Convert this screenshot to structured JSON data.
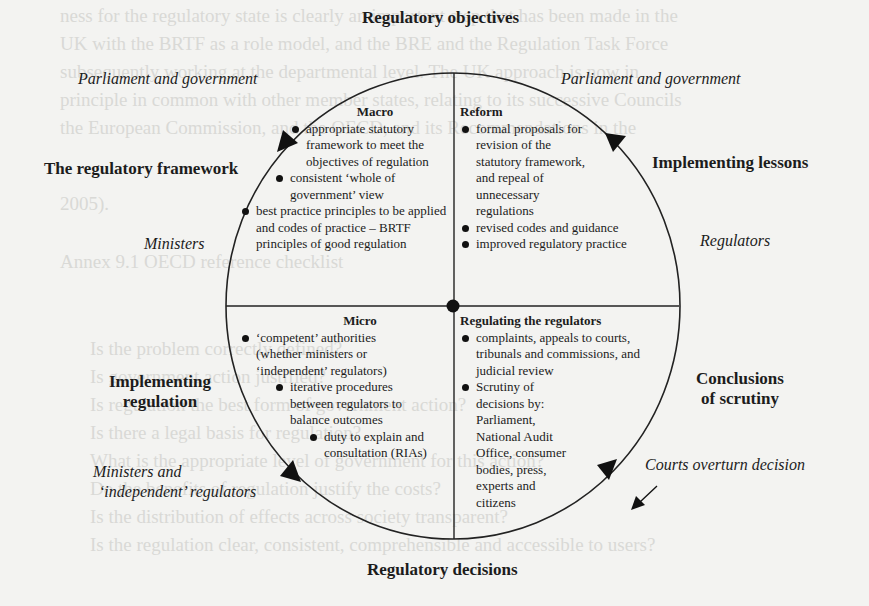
{
  "diagram": {
    "title_top": "Regulatory objectives",
    "title_bottom": "Regulatory decisions",
    "stages": {
      "left_top": "The regulatory framework",
      "right_top": "Implementing lessons",
      "left_bottom_line1": "Implementing",
      "left_bottom_line2": "regulation",
      "right_bottom_line1": "Conclusions",
      "right_bottom_line2": "of scrutiny"
    },
    "actors": {
      "top_left": "Parliament and government",
      "top_right": "Parliament and government",
      "mid_left": "Ministers",
      "mid_right": "Regulators",
      "bottom_left_line1": "Ministers and",
      "bottom_left_line2": "‘independent’ regulators",
      "bottom_right": "Courts overturn decision"
    },
    "quadrants": {
      "macro": {
        "title": "Macro",
        "items": [
          "appropriate statutory framework to meet the objectives of regulation",
          "consistent ‘whole of government’ view",
          "best practice principles to be applied and codes of practice – BRTF principles of good regulation"
        ]
      },
      "reform": {
        "title": "Reform",
        "items": [
          "formal proposals for revision of the statutory framework, and repeal of unnecessary regulations",
          "revised codes and guidance",
          "improved regulatory practice"
        ]
      },
      "micro": {
        "title": "Micro",
        "items": [
          "‘competent’ authorities (whether ministers or ‘independent’ regulators)",
          "iterative procedures between regulators to balance outcomes",
          "duty to explain and consultation (RIAs)"
        ]
      },
      "regulating": {
        "title": "Regulating the regulators",
        "items": [
          "complaints, appeals to courts, tribunals and commissions, and judicial review",
          "Scrutiny of decisions by: Parliament, National Audit Office, consumer bodies, press, experts and citizens"
        ]
      }
    },
    "background_showthrough": [
      "ness for the regulatory state is clearly an important step that has been made in the",
      "UK with the BRTF as a role model, and the BRE and the Regulation Task Force",
      "subsequently working at the departmental level. The UK approach is now in",
      "principle in common with other member states, relating to its successive Councils",
      "the European Commission, and the OECD, and its Recommendations in the",
      "2005).",
      "Annex 9.1  OECD reference checklist",
      "Is the problem correctly defined?",
      "Is government action justified?",
      "Is regulation the best form of government action?",
      "Is there a legal basis for regulation?",
      "What is the appropriate level of government for this action?",
      "Do the benefits of regulation justify the costs?",
      "Is the distribution of effects across society transparent?",
      "Is the regulation clear, consistent, comprehensible and accessible to users?"
    ]
  }
}
